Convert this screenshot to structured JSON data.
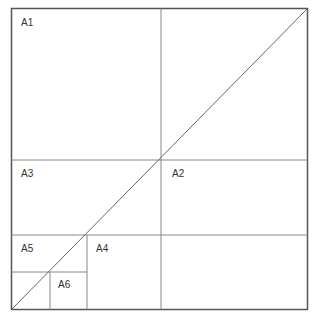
{
  "diagram": {
    "labels": {
      "a1": "A1",
      "a2": "A2",
      "a3": "A3",
      "a4": "A4",
      "a5": "A5",
      "a6": "A6"
    },
    "colors": {
      "border": "#555555",
      "divider": "#888888",
      "text": "#333333",
      "background": "#ffffff"
    }
  }
}
